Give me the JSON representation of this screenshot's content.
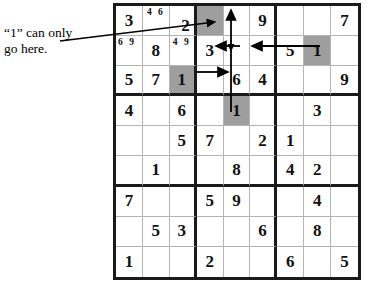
{
  "annotation": {
    "text": "“1” can only\ngo here.",
    "leader_line": "diagonal line from text to shaded cell r1c4"
  },
  "colors": {
    "shaded_cell": "#9e9e9e",
    "grid_thick_line": "#1a1a1a",
    "grid_thin_line": "#b4b4b4",
    "digit": "#111111",
    "background": "#ffffff",
    "arrow": "#000000"
  },
  "grid": {
    "size": 9,
    "box_size": 3,
    "rows": [
      [
        {
          "value": "3",
          "shaded": false,
          "pencil": ""
        },
        {
          "value": "",
          "shaded": false,
          "pencil": "4 6"
        },
        {
          "value": "2",
          "shaded": false,
          "pencil": "",
          "align": "low-right"
        },
        {
          "value": "",
          "shaded": true,
          "pencil": ""
        },
        {
          "value": "",
          "shaded": false,
          "pencil": ""
        },
        {
          "value": "9",
          "shaded": false,
          "pencil": ""
        },
        {
          "value": "",
          "shaded": false,
          "pencil": ""
        },
        {
          "value": "",
          "shaded": false,
          "pencil": ""
        },
        {
          "value": "7",
          "shaded": false,
          "pencil": ""
        }
      ],
      [
        {
          "value": "",
          "shaded": false,
          "pencil": "6 9",
          "pencil_align": "left"
        },
        {
          "value": "8",
          "shaded": false,
          "pencil": ""
        },
        {
          "value": "",
          "shaded": false,
          "pencil": "4 9"
        },
        {
          "value": "3",
          "shaded": false,
          "pencil": ""
        },
        {
          "value": "",
          "shaded": false,
          "pencil": ""
        },
        {
          "value": "",
          "shaded": false,
          "pencil": ""
        },
        {
          "value": "5",
          "shaded": false,
          "pencil": ""
        },
        {
          "value": "1",
          "shaded": true,
          "pencil": ""
        },
        {
          "value": "",
          "shaded": false,
          "pencil": ""
        }
      ],
      [
        {
          "value": "5",
          "shaded": false,
          "pencil": ""
        },
        {
          "value": "7",
          "shaded": false,
          "pencil": ""
        },
        {
          "value": "1",
          "shaded": true,
          "pencil": ""
        },
        {
          "value": "",
          "shaded": false,
          "pencil": ""
        },
        {
          "value": "6",
          "shaded": false,
          "pencil": ""
        },
        {
          "value": "4",
          "shaded": false,
          "pencil": ""
        },
        {
          "value": "",
          "shaded": false,
          "pencil": ""
        },
        {
          "value": "",
          "shaded": false,
          "pencil": ""
        },
        {
          "value": "9",
          "shaded": false,
          "pencil": ""
        }
      ],
      [
        {
          "value": "4",
          "shaded": false,
          "pencil": ""
        },
        {
          "value": "",
          "shaded": false,
          "pencil": ""
        },
        {
          "value": "6",
          "shaded": false,
          "pencil": ""
        },
        {
          "value": "",
          "shaded": false,
          "pencil": ""
        },
        {
          "value": "1",
          "shaded": true,
          "pencil": ""
        },
        {
          "value": "",
          "shaded": false,
          "pencil": ""
        },
        {
          "value": "",
          "shaded": false,
          "pencil": ""
        },
        {
          "value": "3",
          "shaded": false,
          "pencil": ""
        },
        {
          "value": "",
          "shaded": false,
          "pencil": ""
        }
      ],
      [
        {
          "value": "",
          "shaded": false,
          "pencil": ""
        },
        {
          "value": "",
          "shaded": false,
          "pencil": ""
        },
        {
          "value": "5",
          "shaded": false,
          "pencil": ""
        },
        {
          "value": "7",
          "shaded": false,
          "pencil": ""
        },
        {
          "value": "",
          "shaded": false,
          "pencil": ""
        },
        {
          "value": "2",
          "shaded": false,
          "pencil": ""
        },
        {
          "value": "1",
          "shaded": false,
          "pencil": ""
        },
        {
          "value": "",
          "shaded": false,
          "pencil": ""
        },
        {
          "value": "",
          "shaded": false,
          "pencil": ""
        }
      ],
      [
        {
          "value": "",
          "shaded": false,
          "pencil": ""
        },
        {
          "value": "1",
          "shaded": false,
          "pencil": ""
        },
        {
          "value": "",
          "shaded": false,
          "pencil": ""
        },
        {
          "value": "",
          "shaded": false,
          "pencil": ""
        },
        {
          "value": "8",
          "shaded": false,
          "pencil": ""
        },
        {
          "value": "",
          "shaded": false,
          "pencil": ""
        },
        {
          "value": "4",
          "shaded": false,
          "pencil": ""
        },
        {
          "value": "2",
          "shaded": false,
          "pencil": ""
        },
        {
          "value": "",
          "shaded": false,
          "pencil": ""
        }
      ],
      [
        {
          "value": "7",
          "shaded": false,
          "pencil": ""
        },
        {
          "value": "",
          "shaded": false,
          "pencil": ""
        },
        {
          "value": "",
          "shaded": false,
          "pencil": ""
        },
        {
          "value": "5",
          "shaded": false,
          "pencil": ""
        },
        {
          "value": "9",
          "shaded": false,
          "pencil": ""
        },
        {
          "value": "",
          "shaded": false,
          "pencil": ""
        },
        {
          "value": "",
          "shaded": false,
          "pencil": ""
        },
        {
          "value": "4",
          "shaded": false,
          "pencil": ""
        },
        {
          "value": "",
          "shaded": false,
          "pencil": ""
        }
      ],
      [
        {
          "value": "",
          "shaded": false,
          "pencil": ""
        },
        {
          "value": "5",
          "shaded": false,
          "pencil": ""
        },
        {
          "value": "3",
          "shaded": false,
          "pencil": ""
        },
        {
          "value": "",
          "shaded": false,
          "pencil": ""
        },
        {
          "value": "",
          "shaded": false,
          "pencil": ""
        },
        {
          "value": "6",
          "shaded": false,
          "pencil": ""
        },
        {
          "value": "",
          "shaded": false,
          "pencil": ""
        },
        {
          "value": "8",
          "shaded": false,
          "pencil": ""
        },
        {
          "value": "",
          "shaded": false,
          "pencil": ""
        }
      ],
      [
        {
          "value": "1",
          "shaded": false,
          "pencil": ""
        },
        {
          "value": "",
          "shaded": false,
          "pencil": ""
        },
        {
          "value": "",
          "shaded": false,
          "pencil": ""
        },
        {
          "value": "2",
          "shaded": false,
          "pencil": ""
        },
        {
          "value": "",
          "shaded": false,
          "pencil": ""
        },
        {
          "value": "",
          "shaded": false,
          "pencil": ""
        },
        {
          "value": "6",
          "shaded": false,
          "pencil": ""
        },
        {
          "value": "",
          "shaded": false,
          "pencil": ""
        },
        {
          "value": "5",
          "shaded": false,
          "pencil": ""
        }
      ]
    ]
  },
  "arrows": [
    {
      "name": "arrow-up-column5",
      "direction": "up",
      "note": "vertical shaft in column 5 pointing up to row 1"
    },
    {
      "name": "arrow-down-to-shaded-r4c5",
      "direction": "down",
      "note": "vertical shaft in column 5 pointing down into shaded cell r4c5"
    },
    {
      "name": "arrow-left-from-r2c8",
      "direction": "left",
      "note": "from the shaded 1 at r2c8 pointing left toward centre box"
    },
    {
      "name": "arrow-left-center",
      "direction": "left",
      "note": "short left arrowhead at centre of middle-top box"
    },
    {
      "name": "arrow-right-from-r3c3",
      "direction": "right",
      "note": "from the shaded 1 at r3c3 pointing right into centre-top box"
    },
    {
      "name": "leader-line-annotation",
      "direction": "right",
      "note": "leader from annotation text to shaded cell r1c4"
    }
  ]
}
